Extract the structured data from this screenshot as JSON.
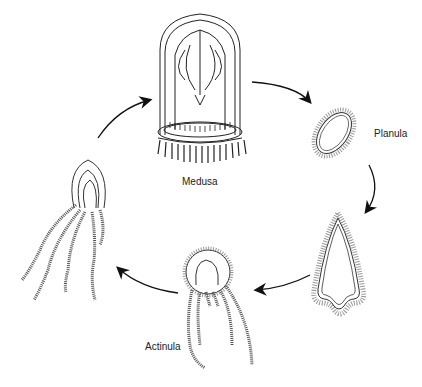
{
  "diagram": {
    "type": "life-cycle",
    "stages": [
      {
        "id": "medusa",
        "label": "Medusa"
      },
      {
        "id": "planula",
        "label": "Planula"
      },
      {
        "id": "settled-larva",
        "label": ""
      },
      {
        "id": "actinula",
        "label": "Actinula"
      },
      {
        "id": "polyp",
        "label": ""
      }
    ],
    "arrows": [
      {
        "from": "medusa",
        "to": "planula"
      },
      {
        "from": "planula",
        "to": "settled-larva"
      },
      {
        "from": "settled-larva",
        "to": "actinula"
      },
      {
        "from": "actinula",
        "to": "polyp"
      },
      {
        "from": "polyp",
        "to": "medusa"
      }
    ],
    "colors": {
      "line": "#111111",
      "background": "#ffffff"
    }
  }
}
